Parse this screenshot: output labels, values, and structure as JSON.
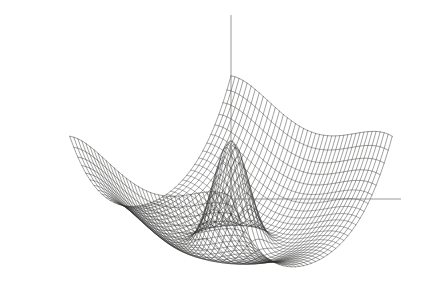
{
  "figure": {
    "title": "",
    "caption": "",
    "background_color": "#ffffff",
    "line_color": "#30302f",
    "axis_color": "#6d6d6c",
    "width_px": 423,
    "height_px": 286
  },
  "chart_data": {
    "type": "line",
    "render": "wireframe-surface-3d",
    "title": "",
    "subtitle": "",
    "xlabel": "",
    "ylabel": "",
    "zlabel": "",
    "legend": [],
    "grid": true,
    "legend_position": "none",
    "surface": {
      "function": "z = 1/(x^2 + y^2) * a  +  saddle/bowl basin",
      "expression": "z(x,y) = peak_amp*exp(-(x^2+y^2)/s) + bowl*(x^2+y^2) - saddle*(x^4 - y^4)",
      "peak_amplitude": 1.0,
      "peak_sharpness": 0.055,
      "bowl_coefficient": 0.52,
      "saddle_coefficient": 0.3,
      "domain_x": [
        -1,
        1
      ],
      "domain_y": [
        -1,
        1
      ],
      "zlim": [
        -0.45,
        1.0
      ],
      "grid_lines_u": 41,
      "grid_lines_v": 41
    },
    "projection": {
      "type": "oblique-parallel",
      "azimuth_deg": 45,
      "elevation_deg": 22,
      "scale_x": 150,
      "scale_y": 150,
      "scale_z": 118,
      "origin_px": [
        231,
        200
      ]
    },
    "axes": [
      {
        "name": "z-axis",
        "orientation": "vertical",
        "from_px": [
          231,
          199
        ],
        "to_px": [
          231,
          15
        ],
        "ticks": [],
        "tick_labels": []
      },
      {
        "name": "y-axis",
        "orientation": "horizontal-right",
        "from_px": [
          231,
          199
        ],
        "to_px": [
          401,
          199
        ],
        "ticks": [],
        "tick_labels": []
      }
    ],
    "annotations": [],
    "features": [
      "tall singular central spike with curved iso-y contour rings",
      "surrounding circular basin / bowl rim",
      "left fold flaring up and out to lower-left corner",
      "right fold flaring up and out to right edge",
      "lower-right flap descending below the basin"
    ]
  },
  "scan_artifacts": {
    "visible": true,
    "description": "very faint ghost of text along the bottom margin from the scanned page",
    "ghost_text_lines": [
      "",
      ""
    ]
  }
}
